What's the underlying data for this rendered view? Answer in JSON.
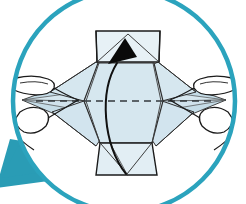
{
  "illustration": {
    "title": "Origami fold step detail",
    "caption": "Magnified circular detail view of hands folding a paper model",
    "type": "instructional-diagram"
  },
  "colors": {
    "circle_ring": "#2ba3bd",
    "callout_tail": "#2a9cb5",
    "paper_fill": "#d6e7ef",
    "paper_fill_shaded": "#c5dce7",
    "paper_fill_light": "#e7f1f6",
    "outline": "#1b1b1b",
    "outline_soft": "#4a4a4a",
    "arrow_fill": "#0a0a0a",
    "background": "#ffffff",
    "hand_fill": "#ffffff"
  },
  "callout": {
    "shape": "circle",
    "center_x": 124,
    "center_y": 101,
    "radius": 113,
    "ring_width": 4,
    "tail_label": "callout pointer tail",
    "tail_points": "0,186 14,141 58,148 74,170"
  },
  "paper_model": {
    "name": "folded paper form",
    "parts": [
      {
        "name": "top-flap",
        "label": "Top rectangular flap",
        "fill_key": "paper_fill_light"
      },
      {
        "name": "upper-left-facet",
        "label": "Upper left facet",
        "fill_key": "paper_fill"
      },
      {
        "name": "upper-right-facet",
        "label": "Upper right facet",
        "fill_key": "paper_fill"
      },
      {
        "name": "center-body",
        "label": "Central diamond body",
        "fill_key": "paper_fill"
      },
      {
        "name": "left-point",
        "label": "Left pinched point",
        "fill_key": "paper_fill_shaded"
      },
      {
        "name": "right-point",
        "label": "Right pinched point",
        "fill_key": "paper_fill_shaded"
      },
      {
        "name": "lower-left-facet",
        "label": "Lower left facet",
        "fill_key": "paper_fill"
      },
      {
        "name": "lower-right-facet",
        "label": "Lower right facet",
        "fill_key": "paper_fill"
      },
      {
        "name": "bottom-flap",
        "label": "Bottom trapezoidal flap",
        "fill_key": "paper_fill_light"
      }
    ]
  },
  "fold_line": {
    "name": "horizontal fold line",
    "style": "dashed",
    "dash_pattern": "7 5",
    "y": 101,
    "x_start": 36,
    "x_end": 212
  },
  "fold_arrow": {
    "name": "curved fold arrow",
    "direction": "upward",
    "shaft_path": "M 126 172 C 104 142 100 92 118 62",
    "head_points": "124,40 110,64 136,58"
  },
  "hands": [
    {
      "name": "left-hand",
      "label": "Left hand pinching point",
      "side": "left"
    },
    {
      "name": "right-hand",
      "label": "Right hand pinching point",
      "side": "right"
    }
  ]
}
